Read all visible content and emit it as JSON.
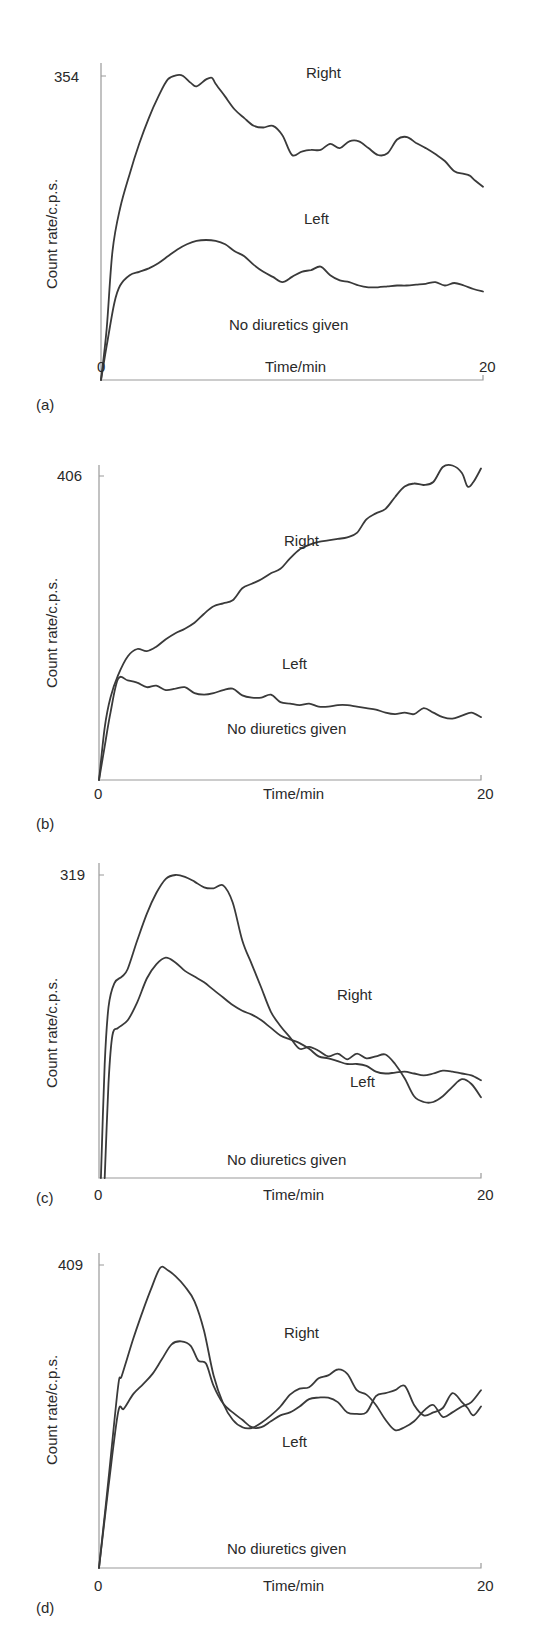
{
  "chart_data": [
    {
      "type": "line",
      "panel_label": "(a)",
      "xlabel": "Time/min",
      "ylabel": "Count rate/c.p.s.",
      "xticks": [
        "0",
        "20"
      ],
      "yticks": [
        "354"
      ],
      "xlim": [
        0,
        20
      ],
      "ylim": [
        0,
        354
      ],
      "annotation": "No diuretics given",
      "series": [
        {
          "name": "Right",
          "x": [
            0,
            0.3,
            0.6,
            1,
            1.5,
            2,
            2.5,
            3,
            3.5,
            4,
            4.3,
            4.7,
            5,
            5.5,
            5.8,
            6,
            6.5,
            7,
            7.5,
            8,
            8.5,
            9,
            9.5,
            10,
            10.5,
            11,
            11.5,
            12,
            12.5,
            13,
            13.5,
            14,
            14.5,
            15,
            15.5,
            16,
            16.5,
            17,
            17.5,
            18,
            18.5,
            19,
            19.3,
            19.6,
            20
          ],
          "values": [
            0,
            60,
            150,
            200,
            240,
            275,
            305,
            330,
            350,
            355,
            354,
            346,
            342,
            350,
            352,
            345,
            330,
            315,
            305,
            296,
            294,
            296,
            285,
            262,
            266,
            268,
            268,
            275,
            270,
            278,
            278,
            270,
            262,
            264,
            280,
            283,
            276,
            270,
            263,
            255,
            243,
            240,
            238,
            232,
            225
          ]
        },
        {
          "name": "Left",
          "x": [
            0,
            0.3,
            0.7,
            1,
            1.5,
            2,
            2.5,
            3,
            3.5,
            4,
            4.5,
            5,
            5.5,
            6,
            6.5,
            7,
            7.5,
            8,
            8.5,
            9,
            9.5,
            10,
            10.5,
            11,
            11.5,
            12,
            12.5,
            13,
            13.5,
            14,
            14.5,
            15,
            15.5,
            16,
            16.5,
            17,
            17.5,
            18,
            18.5,
            19,
            19.5,
            20
          ],
          "values": [
            0,
            40,
            90,
            110,
            122,
            126,
            130,
            136,
            144,
            152,
            158,
            162,
            163,
            162,
            158,
            150,
            144,
            134,
            126,
            120,
            114,
            120,
            126,
            128,
            132,
            122,
            116,
            114,
            110,
            108,
            108,
            109,
            110,
            110,
            111,
            112,
            114,
            110,
            113,
            110,
            106,
            103
          ]
        }
      ]
    },
    {
      "type": "line",
      "panel_label": "(b)",
      "xlabel": "Time/min",
      "ylabel": "Count rate/c.p.s.",
      "xticks": [
        "0",
        "20"
      ],
      "yticks": [
        "406"
      ],
      "xlim": [
        0,
        20
      ],
      "ylim": [
        0,
        406
      ],
      "annotation": "No diuretics given",
      "series": [
        {
          "name": "Right",
          "x": [
            0,
            0.3,
            0.6,
            1,
            1.5,
            2,
            2.5,
            3,
            3.5,
            4,
            4.5,
            5,
            5.5,
            6,
            6.5,
            7,
            7.5,
            8,
            8.5,
            9,
            9.5,
            10,
            10.5,
            11,
            11.5,
            12,
            12.5,
            13,
            13.5,
            14,
            14.5,
            15,
            15.5,
            16,
            16.5,
            17,
            17.5,
            18,
            18.5,
            19,
            19.3,
            19.6,
            20
          ],
          "values": [
            0,
            70,
            110,
            140,
            165,
            175,
            172,
            178,
            188,
            196,
            202,
            210,
            222,
            232,
            236,
            240,
            256,
            262,
            268,
            276,
            282,
            296,
            308,
            314,
            318,
            320,
            322,
            324,
            330,
            348,
            356,
            362,
            378,
            392,
            396,
            394,
            398,
            418,
            420,
            410,
            392,
            398,
            416
          ]
        },
        {
          "name": "Left",
          "x": [
            0,
            0.3,
            0.6,
            1,
            1.5,
            2,
            2.5,
            3,
            3.5,
            4,
            4.5,
            5,
            5.5,
            6,
            6.5,
            7,
            7.5,
            8,
            8.5,
            9,
            9.5,
            10,
            10.5,
            11,
            11.5,
            12,
            12.5,
            13,
            13.5,
            14,
            14.5,
            15,
            15.5,
            16,
            16.5,
            17,
            17.5,
            18,
            18.5,
            19,
            19.5,
            20
          ],
          "values": [
            0,
            45,
            90,
            135,
            133,
            130,
            124,
            126,
            120,
            122,
            124,
            116,
            114,
            116,
            120,
            122,
            113,
            110,
            110,
            114,
            104,
            102,
            100,
            102,
            98,
            98,
            100,
            100,
            98,
            96,
            94,
            90,
            88,
            90,
            88,
            96,
            90,
            84,
            82,
            86,
            90,
            84
          ]
        }
      ]
    },
    {
      "type": "line",
      "panel_label": "(c)",
      "xlabel": "Time/min",
      "ylabel": "Count rate/c.p.s.",
      "xticks": [
        "0",
        "20"
      ],
      "yticks": [
        "319"
      ],
      "xlim": [
        0,
        20
      ],
      "ylim": [
        0,
        319
      ],
      "annotation": "No diuretics given",
      "series": [
        {
          "name": "Right",
          "x": [
            0.1,
            0.3,
            0.5,
            0.8,
            1.2,
            1.5,
            2,
            2.5,
            3,
            3.5,
            4,
            4.5,
            5,
            5.5,
            6,
            6.5,
            7,
            7.5,
            8,
            8.5,
            9,
            9.5,
            10,
            10.5,
            11,
            11.5,
            12,
            12.5,
            13,
            13.5,
            14,
            14.5,
            15,
            15.5,
            16,
            16.5,
            17,
            17.5,
            18,
            18.5,
            19,
            19.5,
            20
          ],
          "values": [
            0,
            120,
            180,
            205,
            212,
            220,
            250,
            278,
            300,
            315,
            319,
            317,
            312,
            306,
            305,
            308,
            290,
            250,
            225,
            200,
            175,
            160,
            148,
            136,
            138,
            134,
            128,
            131,
            125,
            131,
            126,
            128,
            130,
            120,
            105,
            86,
            80,
            80,
            86,
            96,
            104,
            99,
            85
          ]
        },
        {
          "name": "Left",
          "x": [
            0.3,
            0.5,
            0.7,
            1,
            1.5,
            2,
            2.5,
            3,
            3.5,
            4,
            4.5,
            5,
            5.5,
            6,
            6.5,
            7,
            7.5,
            8,
            8.5,
            9,
            9.5,
            10,
            10.5,
            11,
            11.5,
            12,
            12.5,
            13,
            13.5,
            14,
            14.5,
            15,
            15.5,
            16,
            16.5,
            17,
            17.5,
            18,
            18.5,
            19,
            19.5,
            20
          ],
          "values": [
            0,
            100,
            150,
            158,
            166,
            185,
            210,
            225,
            232,
            227,
            218,
            212,
            206,
            198,
            190,
            182,
            176,
            172,
            166,
            158,
            150,
            146,
            142,
            136,
            128,
            126,
            123,
            120,
            120,
            118,
            112,
            110,
            111,
            112,
            110,
            108,
            110,
            113,
            112,
            110,
            108,
            103
          ]
        }
      ]
    },
    {
      "type": "line",
      "panel_label": "(d)",
      "xlabel": "Time/min",
      "ylabel": "Count rate/c.p.s.",
      "xticks": [
        "0",
        "20"
      ],
      "yticks": [
        "409"
      ],
      "xlim": [
        0,
        20
      ],
      "ylim": [
        0,
        409
      ],
      "annotation": "No diuretics given",
      "series": [
        {
          "name": "Right",
          "x": [
            0,
            0.5,
            1,
            1.2,
            1.8,
            2.2,
            2.7,
            3.2,
            3.6,
            4,
            4.5,
            5,
            5.5,
            6,
            6.5,
            7,
            7.5,
            8,
            8.5,
            9,
            9.5,
            10,
            10.5,
            11,
            11.5,
            12,
            12.5,
            13,
            13.5,
            14,
            14.5,
            15,
            15.5,
            16,
            16.5,
            17,
            17.5,
            18,
            18.5,
            19,
            19.5,
            20
          ],
          "values": [
            0,
            120,
            245,
            260,
            310,
            340,
            375,
            405,
            402,
            394,
            380,
            360,
            320,
            260,
            222,
            200,
            190,
            189,
            196,
            206,
            218,
            234,
            242,
            244,
            256,
            260,
            268,
            262,
            240,
            234,
            220,
            200,
            186,
            190,
            198,
            212,
            220,
            204,
            210,
            218,
            224,
            240
          ]
        },
        {
          "name": "Left",
          "x": [
            0,
            0.5,
            1,
            1.3,
            1.8,
            2.3,
            2.8,
            3.3,
            3.8,
            4.3,
            4.8,
            5.2,
            5.6,
            6,
            6.5,
            7,
            7.5,
            8,
            8.5,
            9,
            9.5,
            10,
            10.5,
            11,
            11.5,
            12,
            12.5,
            13,
            13.5,
            14,
            14.5,
            15,
            15.5,
            16,
            16.5,
            17,
            17.5,
            18,
            18.5,
            19,
            19.3,
            19.6,
            20
          ],
          "values": [
            0,
            110,
            210,
            215,
            235,
            248,
            262,
            282,
            302,
            306,
            300,
            280,
            276,
            246,
            222,
            210,
            200,
            190,
            190,
            198,
            206,
            210,
            218,
            228,
            230,
            230,
            224,
            210,
            208,
            210,
            232,
            236,
            240,
            246,
            220,
            206,
            210,
            216,
            236,
            224,
            216,
            206,
            218
          ]
        }
      ]
    }
  ],
  "panels": [
    {
      "label": "(a)",
      "ytick": "354",
      "xtick0": "0",
      "xtick20": "20",
      "xlabel": "Time/min",
      "ylabel": "Count rate/c.p.s.",
      "annotation": "No diuretics given",
      "right_label": "Right",
      "left_label": "Left"
    },
    {
      "label": "(b)",
      "ytick": "406",
      "xtick0": "0",
      "xtick20": "20",
      "xlabel": "Time/min",
      "ylabel": "Count rate/c.p.s.",
      "annotation": "No diuretics given",
      "right_label": "Right",
      "left_label": "Left"
    },
    {
      "label": "(c)",
      "ytick": "319",
      "xtick0": "0",
      "xtick20": "20",
      "xlabel": "Time/min",
      "ylabel": "Count rate/c.p.s.",
      "annotation": "No diuretics given",
      "right_label": "Right",
      "left_label": "Left"
    },
    {
      "label": "(d)",
      "ytick": "409",
      "xtick0": "0",
      "xtick20": "20",
      "xlabel": "Time/min",
      "ylabel": "Count rate/c.p.s.",
      "annotation": "No diuretics given",
      "right_label": "Right",
      "left_label": "Left"
    }
  ],
  "colors": {
    "curve": "#3a3a3a",
    "axis": "#9a9a9a",
    "text": "#2a2a2a",
    "background": "#ffffff"
  }
}
